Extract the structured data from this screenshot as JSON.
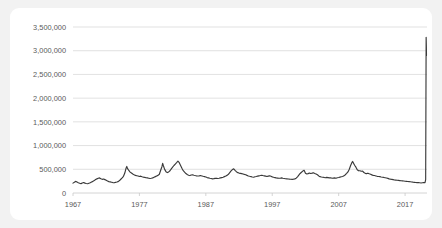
{
  "chart_data": {
    "type": "line",
    "title": "",
    "subtitle": "",
    "xlabel": "",
    "ylabel": "",
    "grid": true,
    "legend": "none",
    "xlim": [
      1967,
      2020.3
    ],
    "ylim": [
      0,
      3500000
    ],
    "ytick_labels": [
      "3,500,000",
      "3,000,000",
      "2,500,000",
      "2,000,000",
      "1,500,000",
      "1,000,000",
      "500,000",
      "0"
    ],
    "ytick_values": [
      3500000,
      3000000,
      2500000,
      2000000,
      1500000,
      1000000,
      500000,
      0
    ],
    "xtick_labels": [
      "1967",
      "1977",
      "1987",
      "1997",
      "2007",
      "2017"
    ],
    "xtick_values": [
      1967,
      1977,
      1987,
      1997,
      2007,
      2017
    ],
    "line_color": "#3a3a3a",
    "grid_color": "#d9d9d9",
    "axis_color": "#c9c9c9",
    "background_color": "#ffffff",
    "card_color": "#f2f2f2",
    "series": [
      {
        "name": "Initial Claims",
        "x": [
          1967.0,
          1967.2,
          1967.4,
          1967.6,
          1967.8,
          1968.0,
          1968.2,
          1968.4,
          1968.6,
          1968.8,
          1969.0,
          1969.2,
          1969.4,
          1969.6,
          1969.8,
          1970.0,
          1970.2,
          1970.4,
          1970.6,
          1970.8,
          1971.0,
          1971.2,
          1971.4,
          1971.6,
          1971.8,
          1972.0,
          1972.2,
          1972.4,
          1972.6,
          1972.8,
          1973.0,
          1973.2,
          1973.4,
          1973.6,
          1973.8,
          1974.0,
          1974.2,
          1974.4,
          1974.6,
          1974.8,
          1975.0,
          1975.1,
          1975.2,
          1975.4,
          1975.6,
          1975.8,
          1976.0,
          1976.2,
          1976.4,
          1976.6,
          1976.8,
          1977.0,
          1977.2,
          1977.4,
          1977.6,
          1977.8,
          1978.0,
          1978.2,
          1978.4,
          1978.6,
          1978.8,
          1979.0,
          1979.2,
          1979.4,
          1979.6,
          1979.8,
          1980.0,
          1980.2,
          1980.4,
          1980.5,
          1980.6,
          1980.8,
          1981.0,
          1981.2,
          1981.4,
          1981.6,
          1981.8,
          1982.0,
          1982.2,
          1982.4,
          1982.6,
          1982.8,
          1983.0,
          1983.2,
          1983.4,
          1983.6,
          1983.8,
          1984.0,
          1984.2,
          1984.4,
          1984.6,
          1984.8,
          1985.0,
          1985.2,
          1985.4,
          1985.6,
          1985.8,
          1986.0,
          1986.2,
          1986.4,
          1986.6,
          1986.8,
          1987.0,
          1987.2,
          1987.4,
          1987.6,
          1987.8,
          1988.0,
          1988.2,
          1988.4,
          1988.6,
          1988.8,
          1989.0,
          1989.2,
          1989.4,
          1989.6,
          1989.8,
          1990.0,
          1990.2,
          1990.4,
          1990.6,
          1990.8,
          1991.0,
          1991.2,
          1991.4,
          1991.6,
          1991.8,
          1992.0,
          1992.2,
          1992.4,
          1992.6,
          1992.8,
          1993.0,
          1993.2,
          1993.4,
          1993.6,
          1993.8,
          1994.0,
          1994.2,
          1994.4,
          1994.6,
          1994.8,
          1995.0,
          1995.2,
          1995.4,
          1995.6,
          1995.8,
          1996.0,
          1996.2,
          1996.4,
          1996.6,
          1996.8,
          1997.0,
          1997.2,
          1997.4,
          1997.6,
          1997.8,
          1998.0,
          1998.2,
          1998.4,
          1998.6,
          1998.8,
          1999.0,
          1999.2,
          1999.4,
          1999.6,
          1999.8,
          2000.0,
          2000.2,
          2000.4,
          2000.6,
          2000.8,
          2001.0,
          2001.2,
          2001.4,
          2001.6,
          2001.8,
          2002.0,
          2002.2,
          2002.4,
          2002.6,
          2002.8,
          2003.0,
          2003.2,
          2003.4,
          2003.6,
          2003.8,
          2004.0,
          2004.2,
          2004.4,
          2004.6,
          2004.8,
          2005.0,
          2005.2,
          2005.4,
          2005.6,
          2005.8,
          2006.0,
          2006.2,
          2006.4,
          2006.6,
          2006.8,
          2007.0,
          2007.2,
          2007.4,
          2007.6,
          2007.8,
          2008.0,
          2008.2,
          2008.4,
          2008.6,
          2008.8,
          2009.0,
          2009.1,
          2009.2,
          2009.4,
          2009.6,
          2009.8,
          2010.0,
          2010.2,
          2010.4,
          2010.6,
          2010.8,
          2011.0,
          2011.2,
          2011.4,
          2011.6,
          2011.8,
          2012.0,
          2012.2,
          2012.4,
          2012.6,
          2012.8,
          2013.0,
          2013.2,
          2013.4,
          2013.6,
          2013.8,
          2014.0,
          2014.2,
          2014.4,
          2014.6,
          2014.8,
          2015.0,
          2015.2,
          2015.4,
          2015.6,
          2015.8,
          2016.0,
          2016.2,
          2016.4,
          2016.6,
          2016.8,
          2017.0,
          2017.2,
          2017.4,
          2017.6,
          2017.8,
          2018.0,
          2018.2,
          2018.4,
          2018.6,
          2018.8,
          2019.0,
          2019.2,
          2019.4,
          2019.6,
          2019.8,
          2020.0,
          2020.1,
          2020.17,
          2020.2,
          2020.22
        ],
        "y": [
          208000,
          225000,
          245000,
          232000,
          218000,
          205000,
          198000,
          212000,
          222000,
          208000,
          200000,
          195000,
          205000,
          215000,
          230000,
          245000,
          262000,
          285000,
          298000,
          310000,
          318000,
          300000,
          288000,
          295000,
          282000,
          268000,
          252000,
          240000,
          235000,
          228000,
          220000,
          215000,
          225000,
          232000,
          240000,
          262000,
          290000,
          318000,
          352000,
          420000,
          528000,
          560000,
          520000,
          475000,
          440000,
          420000,
          400000,
          385000,
          372000,
          365000,
          358000,
          348000,
          355000,
          342000,
          335000,
          330000,
          322000,
          318000,
          312000,
          305000,
          310000,
          318000,
          332000,
          345000,
          358000,
          372000,
          395000,
          480000,
          560000,
          625000,
          580000,
          498000,
          450000,
          430000,
          445000,
          470000,
          510000,
          545000,
          580000,
          610000,
          640000,
          672000,
          640000,
          580000,
          520000,
          470000,
          440000,
          410000,
          390000,
          375000,
          368000,
          380000,
          385000,
          375000,
          368000,
          362000,
          358000,
          362000,
          368000,
          360000,
          352000,
          345000,
          338000,
          325000,
          318000,
          310000,
          305000,
          298000,
          302000,
          308000,
          312000,
          305000,
          310000,
          318000,
          325000,
          332000,
          345000,
          358000,
          372000,
          395000,
          430000,
          465000,
          495000,
          510000,
          478000,
          450000,
          430000,
          420000,
          415000,
          408000,
          400000,
          392000,
          385000,
          372000,
          360000,
          352000,
          345000,
          338000,
          332000,
          342000,
          348000,
          355000,
          362000,
          368000,
          375000,
          368000,
          362000,
          355000,
          348000,
          355000,
          362000,
          352000,
          340000,
          332000,
          325000,
          318000,
          315000,
          310000,
          312000,
          318000,
          310000,
          305000,
          300000,
          298000,
          295000,
          292000,
          290000,
          288000,
          292000,
          298000,
          312000,
          340000,
          378000,
          412000,
          438000,
          462000,
          478000,
          415000,
          400000,
          408000,
          420000,
          412000,
          418000,
          425000,
          412000,
          400000,
          385000,
          360000,
          345000,
          338000,
          332000,
          328000,
          322000,
          330000,
          325000,
          318000,
          320000,
          312000,
          315000,
          318000,
          312000,
          322000,
          328000,
          335000,
          342000,
          348000,
          362000,
          385000,
          412000,
          445000,
          502000,
          580000,
          645000,
          665000,
          640000,
          585000,
          545000,
          490000,
          468000,
          470000,
          458000,
          462000,
          432000,
          415000,
          408000,
          418000,
          405000,
          395000,
          382000,
          372000,
          368000,
          360000,
          352000,
          348000,
          345000,
          338000,
          332000,
          328000,
          322000,
          315000,
          308000,
          298000,
          292000,
          288000,
          282000,
          275000,
          272000,
          268000,
          265000,
          262000,
          258000,
          255000,
          252000,
          248000,
          245000,
          242000,
          240000,
          238000,
          232000,
          228000,
          225000,
          222000,
          220000,
          218000,
          215000,
          212000,
          215000,
          218000,
          220000,
          282000,
          3283000,
          3100000,
          2900000
        ]
      }
    ],
    "annotations": [
      {
        "label": "peak_value",
        "value": 3283000,
        "x": 2020.17
      }
    ]
  }
}
